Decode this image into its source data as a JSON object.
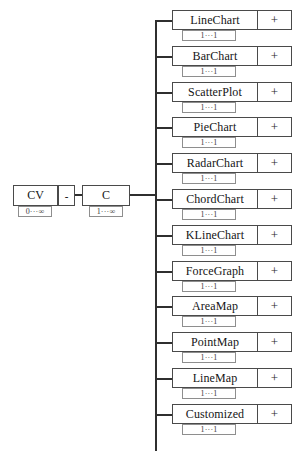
{
  "diagram": {
    "root": {
      "cv": {
        "label": "CV",
        "cardinality": "0···∞"
      },
      "relation": {
        "label": "-"
      },
      "c": {
        "label": "C",
        "cardinality": "1···∞"
      }
    },
    "expander_symbol": "+",
    "child_cardinality": "1···1",
    "children": [
      {
        "label": "LineChart",
        "cardinality": "1···1",
        "expander": "+"
      },
      {
        "label": "BarChart",
        "cardinality": "1···1",
        "expander": "+"
      },
      {
        "label": "ScatterPlot",
        "cardinality": "1···1",
        "expander": "+"
      },
      {
        "label": "PieChart",
        "cardinality": "1···1",
        "expander": "+"
      },
      {
        "label": "RadarChart",
        "cardinality": "1···1",
        "expander": "+"
      },
      {
        "label": "ChordChart",
        "cardinality": "1···1",
        "expander": "+"
      },
      {
        "label": "KLineChart",
        "cardinality": "1···1",
        "expander": "+"
      },
      {
        "label": "ForceGraph",
        "cardinality": "1···1",
        "expander": "+"
      },
      {
        "label": "AreaMap",
        "cardinality": "1···1",
        "expander": "+"
      },
      {
        "label": "PointMap",
        "cardinality": "1···1",
        "expander": "+"
      },
      {
        "label": "LineMap",
        "cardinality": "1···1",
        "expander": "+"
      },
      {
        "label": "Customized",
        "cardinality": "1···1",
        "expander": "+"
      }
    ],
    "colors": {
      "border": "#4a4a4a",
      "connector": "#2f2f2f",
      "chip_border": "#8e8e8e",
      "text": "#151515",
      "background": "#ffffff"
    },
    "layout": {
      "child_count": 13,
      "first_child_center_y": 20,
      "child_pitch_y": 35.8,
      "trunk_x": 155,
      "node_left": 172,
      "node_right": 292
    }
  }
}
